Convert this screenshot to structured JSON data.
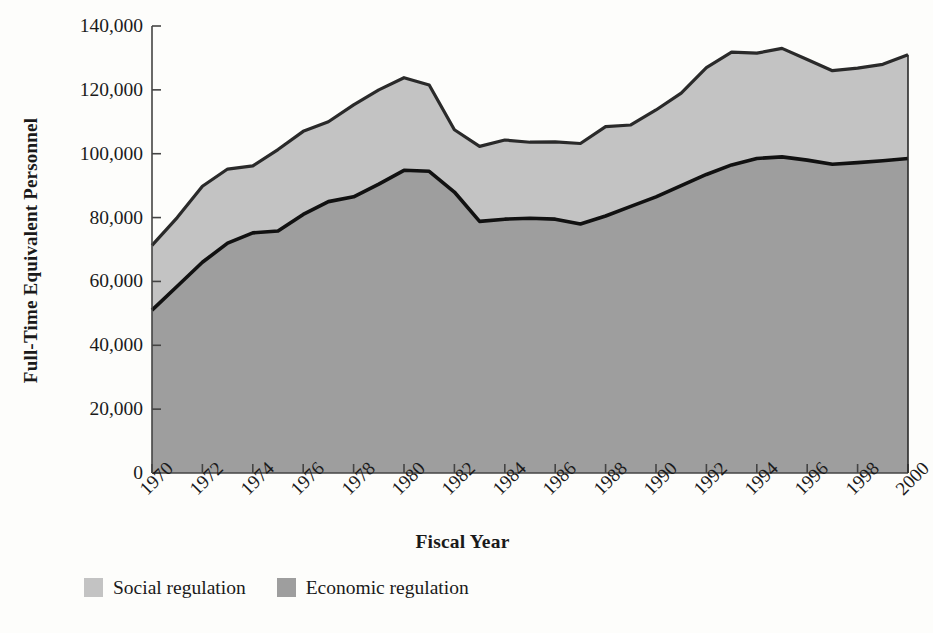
{
  "chart_data": {
    "type": "area",
    "stacked": true,
    "title": "",
    "xlabel": "Fiscal Year",
    "ylabel": "Full-Time Equivalent Personnel",
    "xlim": [
      1970,
      2000
    ],
    "ylim": [
      0,
      140000
    ],
    "ytick_labels": [
      "140,000",
      "120,000",
      "100,000",
      "80,000",
      "60,000",
      "40,000",
      "20,000",
      "0"
    ],
    "ytick_values": [
      140000,
      120000,
      100000,
      80000,
      60000,
      40000,
      20000,
      0
    ],
    "xtick_labels": [
      "1970",
      "1972",
      "1974",
      "1976",
      "1978",
      "1980",
      "1982",
      "1984",
      "1986",
      "1988",
      "1990",
      "1992",
      "1994",
      "1996",
      "1998",
      "2000"
    ],
    "xtick_values": [
      1970,
      1972,
      1974,
      1976,
      1978,
      1980,
      1982,
      1984,
      1986,
      1988,
      1990,
      1992,
      1994,
      1996,
      1998,
      2000
    ],
    "grid": false,
    "legend_position": "below-left",
    "x": [
      1970,
      1971,
      1972,
      1973,
      1974,
      1975,
      1976,
      1977,
      1978,
      1979,
      1980,
      1981,
      1982,
      1983,
      1984,
      1985,
      1986,
      1987,
      1988,
      1989,
      1990,
      1991,
      1992,
      1993,
      1994,
      1995,
      1996,
      1997,
      1998,
      1999,
      2000
    ],
    "series": [
      {
        "name": "Economic regulation",
        "color": "#9e9e9e",
        "values": [
          51000,
          58500,
          66000,
          72000,
          75200,
          75800,
          81000,
          85000,
          86500,
          90500,
          94800,
          94500,
          88000,
          78800,
          79500,
          79800,
          79500,
          78000,
          80500,
          83500,
          86500,
          90000,
          93500,
          96500,
          98500,
          99000,
          98000,
          96700,
          97200,
          97800,
          98500
        ]
      },
      {
        "name": "Social regulation",
        "color": "#c3c3c3",
        "values": [
          20300,
          21500,
          23800,
          23200,
          21000,
          25500,
          26000,
          25000,
          28800,
          29500,
          29000,
          27000,
          19500,
          23500,
          24800,
          23800,
          24200,
          25200,
          28000,
          25500,
          27200,
          29000,
          33500,
          35300,
          33000,
          34000,
          31500,
          29300,
          29600,
          30200,
          32500
        ]
      }
    ],
    "totals": [
      71300,
      80000,
      89800,
      95200,
      96200,
      101300,
      107000,
      110000,
      115300,
      120000,
      123800,
      121500,
      107500,
      102300,
      104300,
      103600,
      103700,
      103200,
      108500,
      109000,
      113700,
      119000,
      127000,
      131800,
      131500,
      133000,
      129500,
      126000,
      126800,
      128000,
      131000
    ]
  },
  "legend": {
    "items": [
      {
        "label": "Social regulation",
        "color": "#c3c3c3"
      },
      {
        "label": "Economic regulation",
        "color": "#9e9e9e"
      }
    ]
  },
  "axes": {
    "y_title": "Full-Time Equivalent Personnel",
    "x_title": "Fiscal Year"
  }
}
